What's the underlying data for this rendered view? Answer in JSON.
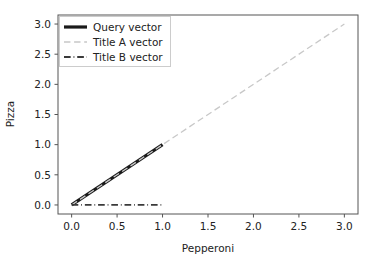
{
  "chart_data": {
    "type": "line",
    "title": "",
    "xlabel": "Pepperoni",
    "ylabel": "Pizza",
    "xlim": [
      -0.15,
      3.15
    ],
    "ylim": [
      -0.15,
      3.15
    ],
    "xticks": [
      "0.0",
      "0.5",
      "1.0",
      "1.5",
      "2.0",
      "2.5",
      "3.0"
    ],
    "xtick_values": [
      0.0,
      0.5,
      1.0,
      1.5,
      2.0,
      2.5,
      3.0
    ],
    "yticks": [
      "0.0",
      "0.5",
      "1.0",
      "1.5",
      "2.0",
      "2.5",
      "3.0"
    ],
    "ytick_values": [
      0.0,
      0.5,
      1.0,
      1.5,
      2.0,
      2.5,
      3.0
    ],
    "grid": false,
    "legend_position": "upper left",
    "series": [
      {
        "name": "Query vector",
        "x": [
          0.0,
          1.0
        ],
        "y": [
          0.0,
          1.0
        ],
        "color": "#1a1a1a",
        "linestyle": "solid",
        "linewidth": 3.2
      },
      {
        "name": "Title A vector",
        "x": [
          0.0,
          3.0
        ],
        "y": [
          0.0,
          3.0
        ],
        "color": "#c8c8c8",
        "linestyle": "dashed",
        "linewidth": 1.3
      },
      {
        "name": "Title B vector",
        "x": [
          0.0,
          1.0
        ],
        "y": [
          0.0,
          0.0
        ],
        "color": "#3a3a3a",
        "linestyle": "dashdot",
        "linewidth": 1.8
      }
    ]
  },
  "legend": {
    "entries": [
      {
        "label": "Query vector"
      },
      {
        "label": "Title A vector"
      },
      {
        "label": "Title B vector"
      }
    ]
  },
  "axes": {
    "xlabel": "Pepperoni",
    "ylabel": "Pizza"
  }
}
